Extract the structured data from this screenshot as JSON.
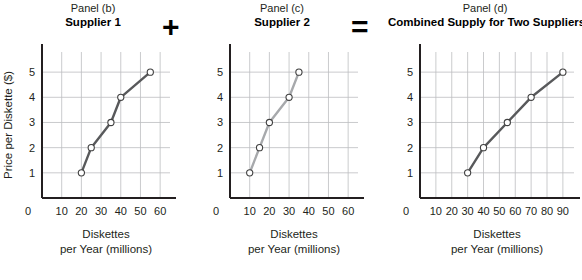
{
  "operators": {
    "plus": "+",
    "equals": "="
  },
  "axis": {
    "ylabel": "Price per Diskette ($)",
    "xlabel_line1": "Diskettes",
    "xlabel_line2": "per Year (millions)",
    "origin_label": "0",
    "y_ticks": [
      "1",
      "2",
      "3",
      "4",
      "5"
    ]
  },
  "colors": {
    "supplier1_line": "#58595b",
    "supplier2_line": "#a7a9ac",
    "combined_line": "#58595b",
    "grid": "#bcbec0",
    "axis": "#231f20",
    "marker_fill": "#ffffff",
    "text": "#231f20"
  },
  "chart_data": [
    {
      "type": "line",
      "panel": "Panel (b)",
      "title": "Supplier 1",
      "xlabel": "Diskettes per Year (millions)",
      "ylabel": "Price per Diskette ($)",
      "xlim": [
        0,
        65
      ],
      "ylim": [
        0,
        5.8
      ],
      "grid": true,
      "legend": "none",
      "x_ticks": [
        10,
        20,
        30,
        40,
        50,
        60
      ],
      "x_tick_labels": [
        "10",
        "20",
        "30",
        "40",
        "50",
        "60"
      ],
      "y_ticks": [
        1,
        2,
        3,
        4,
        5
      ],
      "y_tick_labels": [
        "1",
        "2",
        "3",
        "4",
        "5"
      ],
      "x": [
        20,
        25,
        35,
        40,
        55
      ],
      "values": [
        1,
        2,
        3,
        4,
        5
      ],
      "markers": "open-circle",
      "color": "#58595b"
    },
    {
      "type": "line",
      "panel": "Panel (c)",
      "title": "Supplier 2",
      "xlabel": "Diskettes per Year (millions)",
      "ylabel": "",
      "xlim": [
        0,
        65
      ],
      "ylim": [
        0,
        5.8
      ],
      "grid": true,
      "legend": "none",
      "x_ticks": [
        10,
        20,
        30,
        40,
        50,
        60
      ],
      "x_tick_labels": [
        "10",
        "20",
        "30",
        "40",
        "50",
        "60"
      ],
      "y_ticks": [
        1,
        2,
        3,
        4,
        5
      ],
      "y_tick_labels": [
        "1",
        "2",
        "3",
        "4",
        "5"
      ],
      "x": [
        10,
        15,
        20,
        30,
        35
      ],
      "values": [
        1,
        2,
        3,
        4,
        5
      ],
      "markers": "open-circle",
      "color": "#a7a9ac"
    },
    {
      "type": "line",
      "panel": "Panel (d)",
      "title": "Combined Supply for Two Suppliers",
      "xlabel": "Diskettes per Year (millions)",
      "ylabel": "",
      "xlim": [
        0,
        97
      ],
      "ylim": [
        0,
        5.8
      ],
      "grid": true,
      "legend": "none",
      "x_ticks": [
        10,
        20,
        30,
        40,
        50,
        60,
        70,
        80,
        90
      ],
      "x_tick_labels": [
        "10",
        "20",
        "30",
        "40",
        "50",
        "60",
        "70",
        "80",
        "90"
      ],
      "y_ticks": [
        1,
        2,
        3,
        4,
        5
      ],
      "y_tick_labels": [
        "1",
        "2",
        "3",
        "4",
        "5"
      ],
      "x": [
        30,
        40,
        55,
        70,
        90
      ],
      "values": [
        1,
        2,
        3,
        4,
        5
      ],
      "markers": "open-circle",
      "color": "#58595b"
    }
  ]
}
